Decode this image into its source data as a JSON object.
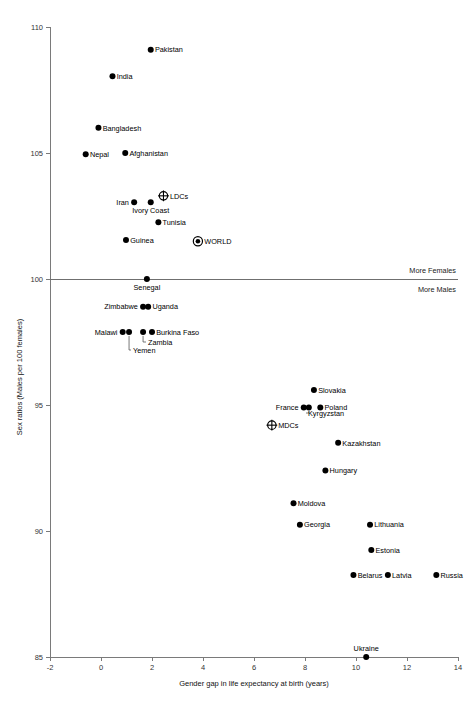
{
  "chart_data": {
    "type": "scatter",
    "title": "",
    "xlabel": "Gender gap in life expectancy at birth (years)",
    "ylabel": "Sex ratios (Males per 100 females)",
    "xlim": [
      -2,
      14
    ],
    "ylim": [
      85,
      110
    ],
    "xticks": [
      -2,
      0,
      2,
      4,
      6,
      8,
      10,
      12,
      14
    ],
    "yticks": [
      85,
      90,
      95,
      100,
      105,
      110
    ],
    "grid": false,
    "legend": "none",
    "reference_lines": [
      {
        "axis": "y",
        "value": 100,
        "above_label": "More Females",
        "below_label": "More Males"
      }
    ],
    "annotations": [
      "More Females",
      "More Males"
    ],
    "points": [
      {
        "name": "Pakistan",
        "x": 1.95,
        "y": 109.1,
        "marker": "dot",
        "label_side": "right"
      },
      {
        "name": "India",
        "x": 0.45,
        "y": 108.05,
        "marker": "dot",
        "label_side": "right"
      },
      {
        "name": "Bangladesh",
        "x": -0.1,
        "y": 106.0,
        "marker": "dot",
        "label_side": "right"
      },
      {
        "name": "Nepal",
        "x": -0.6,
        "y": 104.95,
        "marker": "dot",
        "label_side": "right"
      },
      {
        "name": "Afghanistan",
        "x": 0.95,
        "y": 105.0,
        "marker": "dot",
        "label_side": "right"
      },
      {
        "name": "LDCs",
        "x": 2.45,
        "y": 103.3,
        "marker": "crossed-circle",
        "label_side": "right"
      },
      {
        "name": "Iran",
        "x": 1.3,
        "y": 103.05,
        "marker": "dot",
        "label_side": "left"
      },
      {
        "name": "Ivory Coast",
        "x": 1.95,
        "y": 103.05,
        "marker": "dot",
        "label_side": "below"
      },
      {
        "name": "Tunisia",
        "x": 2.25,
        "y": 102.25,
        "marker": "dot",
        "label_side": "right"
      },
      {
        "name": "WORLD",
        "x": 3.8,
        "y": 101.5,
        "marker": "dotted-circle",
        "label_side": "right"
      },
      {
        "name": "Guinea",
        "x": 0.98,
        "y": 101.55,
        "marker": "dot",
        "label_side": "right"
      },
      {
        "name": "Senegal",
        "x": 1.8,
        "y": 100.0,
        "marker": "dot",
        "label_side": "below"
      },
      {
        "name": "Zimbabwe",
        "x": 1.65,
        "y": 98.9,
        "marker": "dot",
        "label_side": "left"
      },
      {
        "name": "Uganda",
        "x": 1.85,
        "y": 98.9,
        "marker": "dot",
        "label_side": "right"
      },
      {
        "name": "Malawi",
        "x": 0.85,
        "y": 97.9,
        "marker": "dot",
        "label_side": "left"
      },
      {
        "name": "Yemen",
        "x": 1.1,
        "y": 97.9,
        "marker": "dot",
        "label_side": "leader-down"
      },
      {
        "name": "Zambia",
        "x": 1.65,
        "y": 97.9,
        "marker": "dot",
        "label_side": "leader-down"
      },
      {
        "name": "Burkina Faso",
        "x": 2.0,
        "y": 97.9,
        "marker": "dot",
        "label_side": "right"
      },
      {
        "name": "Slovakia",
        "x": 8.35,
        "y": 95.6,
        "marker": "dot",
        "label_side": "right"
      },
      {
        "name": "France",
        "x": 7.95,
        "y": 94.9,
        "marker": "dot",
        "label_side": "left"
      },
      {
        "name": "Kyrgyzstan",
        "x": 8.15,
        "y": 94.9,
        "marker": "dot",
        "label_side": "leader-down"
      },
      {
        "name": "Poland",
        "x": 8.6,
        "y": 94.9,
        "marker": "dot",
        "label_side": "right"
      },
      {
        "name": "MDCs",
        "x": 6.7,
        "y": 94.2,
        "marker": "crossed-circle",
        "label_side": "right"
      },
      {
        "name": "Kazakhstan",
        "x": 9.3,
        "y": 93.5,
        "marker": "dot",
        "label_side": "right"
      },
      {
        "name": "Hungary",
        "x": 8.8,
        "y": 92.4,
        "marker": "dot",
        "label_side": "right"
      },
      {
        "name": "Moldova",
        "x": 7.55,
        "y": 91.1,
        "marker": "dot",
        "label_side": "right"
      },
      {
        "name": "Georgia",
        "x": 7.8,
        "y": 90.25,
        "marker": "dot",
        "label_side": "right"
      },
      {
        "name": "Lithuania",
        "x": 10.55,
        "y": 90.25,
        "marker": "dot",
        "label_side": "right"
      },
      {
        "name": "Estonia",
        "x": 10.6,
        "y": 89.25,
        "marker": "dot",
        "label_side": "right"
      },
      {
        "name": "Belarus",
        "x": 9.9,
        "y": 88.25,
        "marker": "dot",
        "label_side": "right"
      },
      {
        "name": "Latvia",
        "x": 11.25,
        "y": 88.25,
        "marker": "dot",
        "label_side": "right"
      },
      {
        "name": "Russia",
        "x": 13.15,
        "y": 88.25,
        "marker": "dot",
        "label_side": "right"
      },
      {
        "name": "Ukraine",
        "x": 10.4,
        "y": 85.0,
        "marker": "dot",
        "label_side": "above"
      }
    ]
  }
}
